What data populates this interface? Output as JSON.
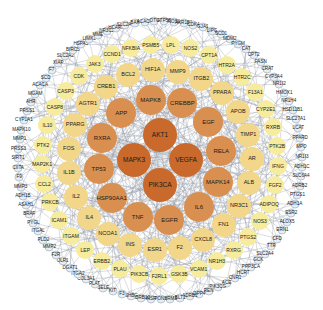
{
  "diagram": {
    "type": "protein-protein interaction network",
    "center": [
      160,
      160
    ],
    "colors": {
      "core": "#c9692c",
      "inner": "#d98f50",
      "middle": "#f2d68a",
      "outer": "#f7ec9e",
      "peripheral": "#ffffff",
      "edge": "#8f97a3",
      "label": "#1a1a1a"
    },
    "rings": [
      {
        "name": "core",
        "radius": 26,
        "node_size": 34,
        "color_key": "core",
        "font": 6.5,
        "nodes": [
          "AKT1",
          "VEGFA",
          "PIK3CA",
          "MAPK3"
        ]
      },
      {
        "name": "inner",
        "radius": 62,
        "node_size": 30,
        "color_key": "inner",
        "font": 6,
        "nodes": [
          "CREBBP",
          "EGF",
          "RELA",
          "MAPK14",
          "IL6",
          "EGFR",
          "TNF",
          "HSP90AA1",
          "TP53",
          "RXRA",
          "APP",
          "MAPK8"
        ]
      },
      {
        "name": "middle",
        "radius": 92,
        "node_size": 24,
        "color_key": "middle",
        "font": 5.5,
        "nodes": [
          "PPARA",
          "APOB",
          "TIMP1",
          "AR",
          "ALB",
          "NR3C1",
          "FN1",
          "CXCL8",
          "F2",
          "ESR1",
          "INS",
          "NCOA1",
          "IL4",
          "IL2",
          "IL1B",
          "FOS",
          "PPARG",
          "AGTR1",
          "CREB1",
          "BCL2",
          "HIF1A",
          "MMP9",
          "ITGB2"
        ]
      },
      {
        "name": "outer",
        "radius": 118,
        "node_size": 18,
        "color_key": "outer",
        "font": 5,
        "nodes": [
          "CYP2E1",
          "RXRB",
          "PTK2B",
          "IFNG",
          "FGF2",
          "ADIPOQ",
          "NOS3",
          "PTGS2",
          "RXRG",
          "NR1H3",
          "VCAM1",
          "GSK3B",
          "F2RL1",
          "PIK3CB",
          "PLAU",
          "ERBB2",
          "LEP",
          "ITGAM",
          "ICAM1",
          "PRKCB",
          "CCL2",
          "MAP2K1",
          "PTK2",
          "IL10",
          "CASP8",
          "CASP3",
          "CDK",
          "JAK3",
          "CCND1",
          "NFKBIA",
          "PSMB5",
          "LPL",
          "NOS2",
          "CPT1A",
          "HTR2A",
          "HTR2C",
          "F13A1"
        ]
      },
      {
        "name": "peripheral",
        "radius": 142,
        "node_size": 7,
        "color_key": "peripheral",
        "font": 4.6,
        "nodes": [
          "MPO",
          "NR1I3",
          "ADH1C",
          "SLC6A4",
          "ADRB2",
          "PTGS1",
          "ADH1A",
          "ESR2",
          "ALOX5",
          "ERN1",
          "CFD",
          "TTR",
          "SLC2A4",
          "GCK",
          "PPP3CA",
          "HCRT",
          "CNR1",
          "ACE",
          "PIK3CG",
          "REN",
          "DPP4",
          "ADRB1",
          "BLT1",
          "HRM3",
          "PON1",
          "INSR",
          "ADRB10",
          "SHBG",
          "F3",
          "KIT",
          "SELE",
          "PLAT",
          "COL3A1",
          "ITGA2",
          "DGAT1",
          "OLR1",
          "F2R",
          "MMP2",
          "PLD2",
          "ITGAL",
          "PYGL",
          "BRAF",
          "ASAH1",
          "ADH1B",
          "MMP3",
          "F9",
          "CIITA",
          "SIRT1",
          "PRSS3",
          "MMP1",
          "MAPK10",
          "CYP1A1",
          "PRSS1",
          "AHR",
          "MGAM",
          "ACACA",
          "SCD",
          "F7",
          "XIAP",
          "SLC2A2",
          "BIRC5",
          "HSPA5",
          "LIMK1",
          "MME",
          "NR3C2",
          "HCAR2",
          "SLC2A1",
          "BAX",
          "ACACB",
          "OTC",
          "ATP5B",
          "NOS1",
          "AKR1B1",
          "CDK4",
          "GJA1",
          "LIPG",
          "SCD1",
          "MDM2",
          "PYGM",
          "CAT",
          "CPT2",
          "FASN",
          "CRAT",
          "CYP3A4",
          "NR1I2",
          "HMOX1",
          "NR1H4",
          "HSD11B1",
          "SLC27A1",
          "LCAT",
          "PPARD"
        ]
      }
    ]
  }
}
